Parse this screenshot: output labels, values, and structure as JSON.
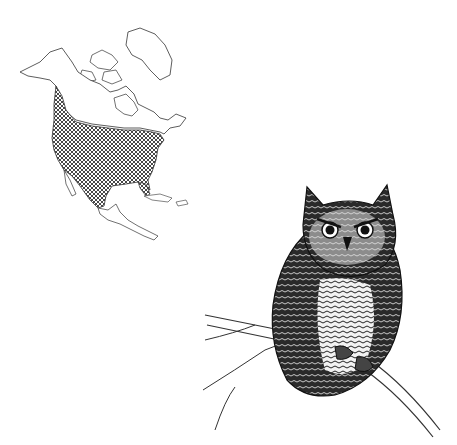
{
  "figure": {
    "background_color": "#ffffff",
    "ink_color": "#1a1a1a",
    "range_fill": "crosshatch",
    "map": {
      "region": "North America",
      "shaded_range": "southern Canada, contiguous United States, Mexico"
    },
    "illustration": {
      "subject": "screech owl on branch",
      "style": "pen-and-ink"
    }
  }
}
